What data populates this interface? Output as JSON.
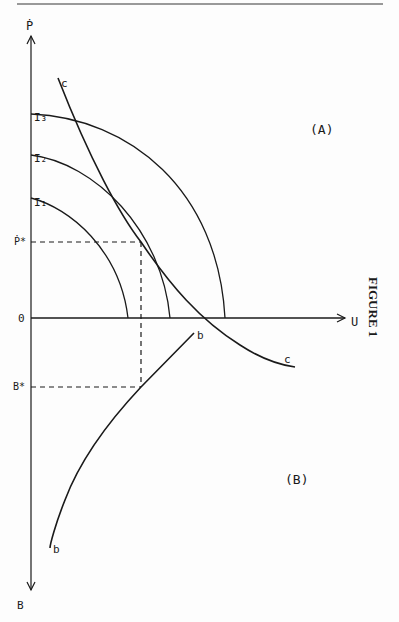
{
  "figure": {
    "caption": "FIGURE 1",
    "panel_a_label": "(A)",
    "panel_b_label": "(B)"
  },
  "axes": {
    "vertical_top_label": "Ṗ",
    "horizontal_label": "U",
    "vertical_bottom_label": "B",
    "origin_label": "0",
    "p_star_label": "Ṗ*",
    "b_star_label": "B*"
  },
  "curves": {
    "indifference": [
      {
        "label": "I₁"
      },
      {
        "label": "I₂"
      },
      {
        "label": "I₃"
      }
    ],
    "c_curve_top_label": "c",
    "c_curve_bottom_label": "c",
    "b_curve_top_label": "b",
    "b_curve_bottom_label": "b"
  },
  "colors": {
    "ink": "#1a1a1a",
    "rule": "#777777"
  }
}
